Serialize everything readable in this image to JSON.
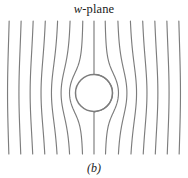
{
  "figure": {
    "title_prefix": "w",
    "title_suffix": "-plane",
    "title_full": "w-plane",
    "caption": "(b)",
    "domain": "complex-plane-field-map"
  },
  "colors": {
    "background": "#ffffff",
    "line": "#7d7d7d",
    "circle": "#7d7d7d",
    "text": "#1a1a1a"
  },
  "chart_data": {
    "type": "line",
    "title": "w-plane",
    "subtitle": "(b)",
    "xlabel": "",
    "ylabel": "",
    "xlim": [
      0,
      188
    ],
    "ylim": [
      0,
      178
    ],
    "grid": false,
    "legend": null,
    "plot_area": {
      "x_left": 8,
      "x_right": 180,
      "y_top": 21,
      "y_bottom": 154
    },
    "obstacle": {
      "shape": "circle",
      "cx": 94,
      "cy": 93,
      "r": 18.5,
      "stroke_width": 1.5
    },
    "flow": {
      "n_lines": 15,
      "direction": "vertical",
      "stroke_width": 1.15,
      "x_positions_at_top": [
        11.5,
        23.5,
        35.5,
        47.5,
        59.5,
        70.0,
        79.5,
        88.0,
        94.0,
        100.5,
        109.5,
        119.0,
        130.0,
        141.5,
        153.0,
        164.0,
        176.0
      ],
      "far_field_x": [
        11.5,
        23.5,
        35.5,
        47.5,
        59.5,
        71.5,
        83.5,
        94.0,
        104.5,
        116.5,
        128.5,
        140.5,
        152.5,
        164.5,
        176.5
      ],
      "deflection_strength": 1.0,
      "sample_points": 140
    },
    "annotations": [
      {
        "text": "w-plane",
        "x": 94,
        "y": 10,
        "role": "title"
      },
      {
        "text": "(b)",
        "x": 94,
        "y": 168,
        "role": "caption"
      }
    ]
  }
}
